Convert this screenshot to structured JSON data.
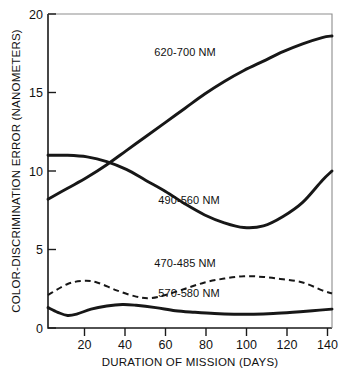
{
  "chart_data": {
    "type": "line",
    "title": "",
    "xlabel": "DURATION OF MISSION (DAYS)",
    "ylabel": "COLOR-DISCRIMINATION ERROR (NANOMETERS)",
    "xlim": [
      0,
      145
    ],
    "ylim": [
      0,
      20
    ],
    "xticks": [
      0,
      20,
      40,
      60,
      80,
      100,
      120,
      140
    ],
    "xticklabels": [
      "",
      "20",
      "40",
      "60",
      "80",
      "100",
      "120",
      "140"
    ],
    "yticks": [
      0,
      5,
      10,
      15,
      20
    ],
    "yticklabels": [
      "0",
      "5",
      "10",
      "15",
      "20"
    ],
    "grid": false,
    "legend": "inline-annotations",
    "series": [
      {
        "name": "620-700 NM",
        "style": "solid",
        "label_x": 70,
        "label_y": 17.3,
        "x": [
          0,
          10,
          20,
          30,
          40,
          50,
          60,
          70,
          80,
          90,
          100,
          110,
          120,
          130,
          140,
          145
        ],
        "y": [
          8.2,
          8.9,
          9.6,
          10.4,
          11.3,
          12.2,
          13.1,
          14.0,
          14.9,
          15.7,
          16.4,
          17.0,
          17.6,
          18.1,
          18.5,
          18.6
        ]
      },
      {
        "name": "490-560 NM",
        "style": "solid",
        "label_x": 72,
        "label_y": 7.9,
        "x": [
          0,
          10,
          20,
          30,
          40,
          50,
          60,
          70,
          80,
          90,
          100,
          110,
          120,
          130,
          140,
          145
        ],
        "y": [
          11.0,
          11.0,
          10.9,
          10.6,
          10.1,
          9.4,
          8.7,
          7.9,
          7.2,
          6.7,
          6.4,
          6.5,
          7.1,
          8.0,
          9.4,
          10.0
        ]
      },
      {
        "name": "470-485 NM",
        "style": "dashed",
        "label_x": 70,
        "label_y": 3.9,
        "x": [
          0,
          10,
          18,
          25,
          35,
          45,
          52,
          60,
          70,
          80,
          90,
          100,
          110,
          120,
          130,
          140,
          145
        ],
        "y": [
          2.1,
          2.8,
          3.0,
          2.9,
          2.4,
          2.0,
          1.9,
          2.1,
          2.5,
          2.9,
          3.15,
          3.3,
          3.25,
          3.1,
          2.9,
          2.4,
          2.2
        ]
      },
      {
        "name": "570-580 NM",
        "style": "solid",
        "label_x": 72,
        "label_y": 2.0,
        "x": [
          0,
          5,
          10,
          15,
          22,
          30,
          38,
          45,
          55,
          65,
          75,
          85,
          95,
          105,
          115,
          125,
          135,
          145
        ],
        "y": [
          1.3,
          1.0,
          0.8,
          0.9,
          1.2,
          1.4,
          1.5,
          1.45,
          1.3,
          1.1,
          1.0,
          0.92,
          0.88,
          0.88,
          0.92,
          1.0,
          1.1,
          1.2
        ]
      }
    ]
  },
  "colors": {
    "ink": "#171717",
    "background": "#ffffff"
  }
}
